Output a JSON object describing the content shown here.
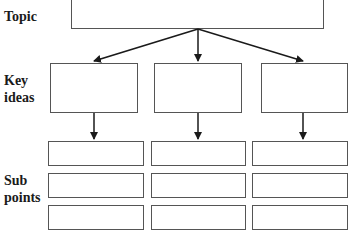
{
  "diagram": {
    "row_labels": {
      "topic": "Topic",
      "key_ideas": [
        "Key",
        "ideas"
      ],
      "sub_points": [
        "Sub",
        "points"
      ]
    },
    "topic_box": {
      "text": ""
    },
    "key_idea_boxes": [
      {
        "text": ""
      },
      {
        "text": ""
      },
      {
        "text": ""
      }
    ],
    "sub_point_boxes": [
      [
        {
          "text": ""
        },
        {
          "text": ""
        },
        {
          "text": ""
        }
      ],
      [
        {
          "text": ""
        },
        {
          "text": ""
        },
        {
          "text": ""
        }
      ],
      [
        {
          "text": ""
        },
        {
          "text": ""
        },
        {
          "text": ""
        }
      ]
    ],
    "colors": {
      "line": "#1a1a1a",
      "box_border": "#555555"
    }
  }
}
